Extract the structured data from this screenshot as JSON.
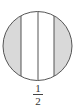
{
  "diagram": {
    "shape": "circle",
    "divisions": 4,
    "shaded_regions": [
      "left-segment",
      "right-segment"
    ],
    "colors": {
      "stroke": "#555555",
      "shade": "#d9d9d9",
      "fill": "#ffffff"
    },
    "label": {
      "numerator": "1",
      "denominator": "2"
    }
  }
}
